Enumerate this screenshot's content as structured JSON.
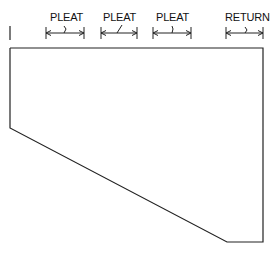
{
  "diagram": {
    "type": "pleated drapery panel template",
    "dimensions": [
      {
        "label": "PLEAT",
        "x1": 46,
        "x2": 84
      },
      {
        "label": "PLEAT",
        "x1": 101,
        "x2": 137
      },
      {
        "label": "PLEAT",
        "x1": 153,
        "x2": 191
      },
      {
        "label": "RETURN",
        "x1": 226,
        "x2": 263
      }
    ],
    "outline_points": "10,48 263,48 263,242 227,242 10,128",
    "colors": {
      "line": "#222222",
      "background": "#ffffff"
    }
  }
}
